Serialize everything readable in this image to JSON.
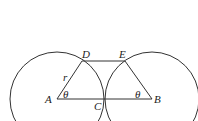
{
  "diagram": {
    "type": "geometry",
    "colors": {
      "stroke": "#333333",
      "text": "#222222",
      "background": "#ffffff"
    },
    "points": {
      "A": {
        "label": "A",
        "x": 57,
        "y": 99
      },
      "B": {
        "label": "B",
        "x": 152,
        "y": 99
      },
      "C": {
        "label": "C",
        "x": 104,
        "y": 99
      },
      "D": {
        "label": "D",
        "x": 82,
        "y": 61
      },
      "E": {
        "label": "E",
        "x": 125,
        "y": 61
      }
    },
    "circles": [
      {
        "center": "A",
        "radius": 47
      },
      {
        "center": "B",
        "radius": 47
      }
    ],
    "segments": [
      [
        "A",
        "B"
      ],
      [
        "A",
        "D"
      ],
      [
        "D",
        "E"
      ],
      [
        "E",
        "B"
      ]
    ],
    "labels": {
      "A": "A",
      "B": "B",
      "C": "C",
      "D": "D",
      "E": "E",
      "radius": "r",
      "angle_A": "θ",
      "angle_B": "θ"
    }
  }
}
